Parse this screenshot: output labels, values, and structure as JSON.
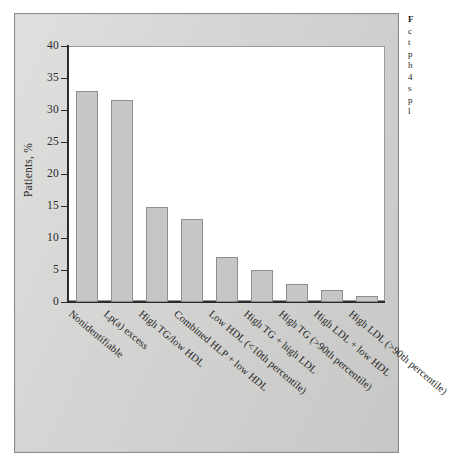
{
  "figure": {
    "panel_background": "#d2d2d0",
    "plot_background": "#ffffff",
    "bar_fill": "#c6c6c4",
    "bar_stroke": "#8e8e8c",
    "axis_color": "#2b2b2b"
  },
  "chart_data": {
    "type": "bar",
    "title": "",
    "xlabel": "",
    "ylabel": "Patients, %",
    "ylim": [
      0,
      40
    ],
    "ytick_labels": [
      "0",
      "5",
      "10",
      "15",
      "20",
      "25",
      "30",
      "35",
      "40"
    ],
    "yticks": [
      0,
      5,
      10,
      15,
      20,
      25,
      30,
      35,
      40
    ],
    "grid": false,
    "legend": "none",
    "categories": [
      "Nonidentifiable",
      "Lp(a) excess",
      "High TG/low HDL",
      "Combined HLP + low HDL",
      "Low HDL (<10th percentile)",
      "High TG + high LDL",
      "High TG (>90th percentile)",
      "High LDL + low HDL",
      "High LDL (>90th percentile)"
    ],
    "values": [
      33,
      31.5,
      14.8,
      12.9,
      7.1,
      5,
      2.8,
      1.9,
      1
    ]
  },
  "caption": {
    "lines": [
      "F",
      "c",
      "t",
      "p",
      "h",
      "4",
      "s",
      "p",
      "l"
    ]
  }
}
